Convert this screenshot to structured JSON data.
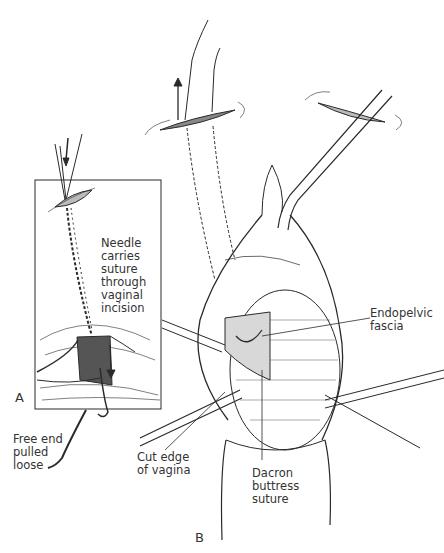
{
  "figure": {
    "panels": [
      {
        "id": "A",
        "letter": "A"
      },
      {
        "id": "B",
        "letter": "B"
      }
    ],
    "labels": {
      "needle": "Needle\ncarries\nsuture\nthrough\nvaginal\nincision",
      "free_end": "Free end\npulled\nloose",
      "endopelvic": "Endopelvic\nfascia",
      "cut_edge": "Cut edge\nof vagina",
      "dacron": "Dacron\nbuttress\nsuture"
    },
    "colors": {
      "ink": "#2a2a2a",
      "background": "#ffffff"
    }
  }
}
